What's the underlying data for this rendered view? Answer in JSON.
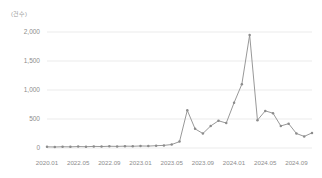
{
  "chart_data": {
    "type": "line",
    "title": "",
    "subtitle": "",
    "unit_label": "(건수)",
    "xlabel": "",
    "ylabel": "",
    "ylim": [
      0,
      2000
    ],
    "y_ticks": [
      0,
      500,
      1000,
      1500,
      2000
    ],
    "y_tick_labels": [
      "0",
      "500",
      "1,000",
      "1,500",
      "2,000"
    ],
    "grid": true,
    "legend": null,
    "legend_position": "none",
    "line_color": "#8c8c8c",
    "marker": "circle",
    "x_tick_labels": [
      "2020.01",
      "2022.05",
      "2022.09",
      "2023.01",
      "2023.05",
      "2023.09",
      "2024.01",
      "2024.05",
      "2024.09"
    ],
    "x_tick_indices": [
      0,
      4,
      8,
      12,
      16,
      20,
      24,
      28,
      32
    ],
    "x": [
      "2022.01",
      "2022.02",
      "2022.03",
      "2022.04",
      "2022.05",
      "2022.06",
      "2022.07",
      "2022.08",
      "2022.09",
      "2022.10",
      "2022.11",
      "2022.12",
      "2023.01",
      "2023.02",
      "2023.03",
      "2023.04",
      "2023.05",
      "2023.06",
      "2023.07",
      "2023.08",
      "2023.09",
      "2023.10",
      "2023.11",
      "2023.12",
      "2024.01",
      "2024.02",
      "2024.03",
      "2024.04",
      "2024.05",
      "2024.06",
      "2024.07",
      "2024.08",
      "2024.09",
      "2024.10",
      "2024.11"
    ],
    "values": [
      20,
      18,
      22,
      20,
      25,
      22,
      28,
      25,
      30,
      28,
      32,
      30,
      35,
      33,
      40,
      45,
      60,
      110,
      650,
      330,
      250,
      380,
      470,
      430,
      780,
      1100,
      1950,
      480,
      640,
      600,
      380,
      420,
      250,
      200,
      260
    ]
  }
}
